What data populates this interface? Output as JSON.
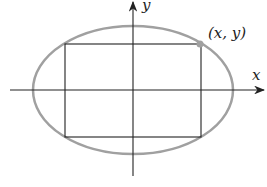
{
  "diagram": {
    "x_axis_label": "x",
    "y_axis_label": "y",
    "point_label": "(x, y)",
    "ellipse_color": "#a0a0a0",
    "line_color": "#222222"
  }
}
